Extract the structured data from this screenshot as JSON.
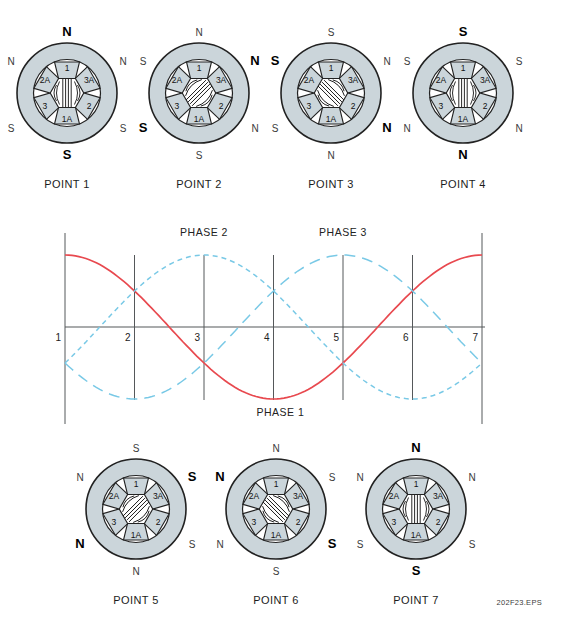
{
  "figure": {
    "footer": "202F23.EPS"
  },
  "stator": {
    "pole_labels_clockwise_from_top": [
      "1",
      "3A",
      "2",
      "1A",
      "3",
      "2A"
    ],
    "ring_color": "#cbd5da",
    "outline_color": "#222222",
    "flux_color": "#111111"
  },
  "points": [
    {
      "name": "POINT 1",
      "flux_angle_deg": 0,
      "magnets": {
        "top": {
          "letter": "N",
          "bold": true
        },
        "top_left": {
          "letter": "N",
          "bold": false
        },
        "top_right": {
          "letter": "N",
          "bold": false
        },
        "bottom_left": {
          "letter": "S",
          "bold": false
        },
        "bottom_right": {
          "letter": "S",
          "bold": false
        },
        "bottom": {
          "letter": "S",
          "bold": true
        }
      }
    },
    {
      "name": "POINT 2",
      "flux_angle_deg": 45,
      "magnets": {
        "top": {
          "letter": "N",
          "bold": false
        },
        "top_left": {
          "letter": "S",
          "bold": false
        },
        "top_right": {
          "letter": "N",
          "bold": true
        },
        "bottom_left": {
          "letter": "S",
          "bold": true
        },
        "bottom_right": {
          "letter": "N",
          "bold": false
        },
        "bottom": {
          "letter": "S",
          "bold": false
        }
      }
    },
    {
      "name": "POINT 3",
      "flux_angle_deg": 135,
      "magnets": {
        "top": {
          "letter": "S",
          "bold": false
        },
        "top_left": {
          "letter": "S",
          "bold": true
        },
        "top_right": {
          "letter": "N",
          "bold": false
        },
        "bottom_left": {
          "letter": "S",
          "bold": false
        },
        "bottom_right": {
          "letter": "N",
          "bold": true
        },
        "bottom": {
          "letter": "N",
          "bold": false
        }
      }
    },
    {
      "name": "POINT 4",
      "flux_angle_deg": 0,
      "magnets": {
        "top": {
          "letter": "S",
          "bold": true
        },
        "top_left": {
          "letter": "S",
          "bold": false
        },
        "top_right": {
          "letter": "S",
          "bold": false
        },
        "bottom_left": {
          "letter": "N",
          "bold": false
        },
        "bottom_right": {
          "letter": "N",
          "bold": false
        },
        "bottom": {
          "letter": "N",
          "bold": true
        }
      }
    },
    {
      "name": "POINT 5",
      "flux_angle_deg": 45,
      "magnets": {
        "top": {
          "letter": "S",
          "bold": false
        },
        "top_left": {
          "letter": "N",
          "bold": false
        },
        "top_right": {
          "letter": "S",
          "bold": true
        },
        "bottom_left": {
          "letter": "N",
          "bold": true
        },
        "bottom_right": {
          "letter": "S",
          "bold": false
        },
        "bottom": {
          "letter": "N",
          "bold": false
        }
      }
    },
    {
      "name": "POINT 6",
      "flux_angle_deg": 135,
      "magnets": {
        "top": {
          "letter": "N",
          "bold": false
        },
        "top_left": {
          "letter": "N",
          "bold": true
        },
        "top_right": {
          "letter": "S",
          "bold": false
        },
        "bottom_left": {
          "letter": "N",
          "bold": false
        },
        "bottom_right": {
          "letter": "S",
          "bold": true
        },
        "bottom": {
          "letter": "S",
          "bold": false
        }
      }
    },
    {
      "name": "POINT 7",
      "flux_angle_deg": 0,
      "magnets": {
        "top": {
          "letter": "N",
          "bold": true
        },
        "top_left": {
          "letter": "N",
          "bold": false
        },
        "top_right": {
          "letter": "N",
          "bold": false
        },
        "bottom_left": {
          "letter": "S",
          "bold": false
        },
        "bottom_right": {
          "letter": "S",
          "bold": false
        },
        "bottom": {
          "letter": "S",
          "bold": true
        }
      }
    }
  ],
  "chart_data": {
    "type": "line",
    "x": [
      1,
      2,
      3,
      4,
      5,
      6,
      7
    ],
    "xlim": [
      1,
      7
    ],
    "ylim": [
      -1,
      1
    ],
    "grid": "vertical",
    "tick_labels": [
      "1",
      "2",
      "3",
      "4",
      "5",
      "6",
      "7"
    ],
    "series": [
      {
        "name": "PHASE 1",
        "style": "solid",
        "color": "#e8494f",
        "shift_deg": 0,
        "values": [
          1,
          0.5,
          -0.5,
          -1,
          -0.5,
          0.5,
          1
        ]
      },
      {
        "name": "PHASE 2",
        "style": "dashed-short",
        "color": "#79c9e6",
        "shift_deg": 120,
        "values": [
          -0.5,
          0.5,
          1,
          0.5,
          -0.5,
          -1,
          -0.5
        ]
      },
      {
        "name": "PHASE 3",
        "style": "dashed-long",
        "color": "#79c9e6",
        "shift_deg": 240,
        "values": [
          -0.5,
          -1,
          -0.5,
          0.5,
          1,
          0.5,
          -0.5
        ]
      }
    ],
    "annotations": [
      {
        "text": "PHASE 2",
        "x": 3.0,
        "pos": "top"
      },
      {
        "text": "PHASE 3",
        "x": 5.0,
        "pos": "top"
      },
      {
        "text": "PHASE 1",
        "x": 4.1,
        "pos": "bottom"
      }
    ],
    "axis_color": "#55585a",
    "text_color": "#222222"
  }
}
